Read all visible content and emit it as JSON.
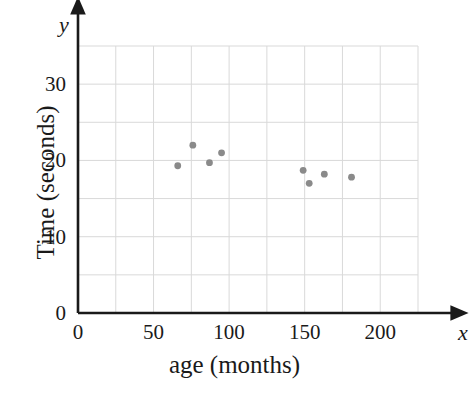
{
  "chart_data": {
    "type": "scatter",
    "title": "",
    "xlabel": "age (months)",
    "ylabel": "Time (seconds)",
    "x_axis_variable": "x",
    "y_axis_variable": "y",
    "xlim": [
      0,
      225
    ],
    "ylim": [
      0,
      35
    ],
    "x_tick_labels": [
      "0",
      "50",
      "100",
      "150",
      "200"
    ],
    "x_tick_values": [
      0,
      50,
      100,
      150,
      200
    ],
    "y_tick_labels": [
      "0",
      "10",
      "20",
      "30"
    ],
    "y_tick_values": [
      0,
      10,
      20,
      30
    ],
    "x_gridline_step": 25,
    "y_gridline_step": 5,
    "grid": true,
    "grid_color": "#d9d9d9",
    "legend": null,
    "point_color": "#8a8a8a",
    "point_radius": 3.4,
    "axis_color": "#1a1a1a",
    "background_color": "#ffffff",
    "points": [
      {
        "x": 66,
        "y": 19.3
      },
      {
        "x": 76,
        "y": 22.0
      },
      {
        "x": 87,
        "y": 19.7
      },
      {
        "x": 95,
        "y": 21.0
      },
      {
        "x": 149,
        "y": 18.7
      },
      {
        "x": 153,
        "y": 17.0
      },
      {
        "x": 163,
        "y": 18.2
      },
      {
        "x": 181,
        "y": 17.8
      }
    ]
  },
  "geometry": {
    "plot_left_px": 78,
    "plot_right_px": 418,
    "plot_bottom_px": 313,
    "plot_top_px": 46,
    "x_axis_arrow_end_px": 453,
    "y_axis_arrow_end_px": 12
  }
}
